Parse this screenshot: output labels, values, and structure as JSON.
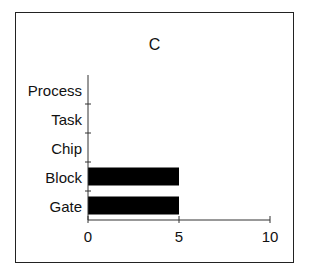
{
  "chart_data": {
    "type": "bar",
    "orientation": "horizontal",
    "title": "C",
    "xlabel": "",
    "ylabel": "",
    "categories": [
      "Process",
      "Task",
      "Chip",
      "Block",
      "Gate"
    ],
    "values": [
      0,
      0,
      0,
      5,
      5
    ],
    "xlim": [
      0,
      10
    ],
    "xticks": [
      "0",
      "5",
      "10"
    ],
    "grid": false,
    "legend": null,
    "bar_color": "#000000"
  }
}
